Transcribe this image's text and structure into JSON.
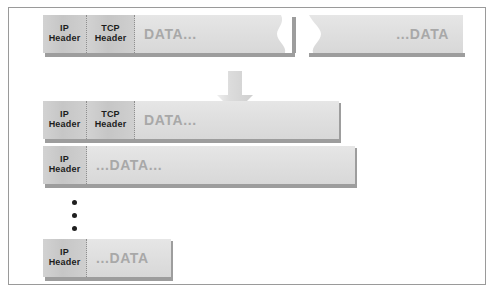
{
  "diagram": {
    "colors": {
      "frame_border": "#9a9a9a",
      "header_fill": "#cccccc",
      "data_fill": "#e0e0e0",
      "data_text": "#a8a8a8",
      "header_text": "#1c1c1c",
      "shadow": "#9d9d9d",
      "arrow": "#d8d8d8",
      "background": "#ffffff"
    },
    "labels": {
      "ip_header_line1": "IP",
      "ip_header_line2": "Header",
      "tcp_header_line1": "TCP",
      "tcp_header_line2": "Header",
      "data_start": "DATA...",
      "data_end": "...DATA",
      "data_middle": "...DATA...",
      "data_last": "...DATA"
    },
    "arrow_icon": "down-arrow-icon",
    "ellipsis_icon": "vertical-ellipsis-icon",
    "tear_icon": "torn-edge-icon",
    "rows": [
      {
        "name": "original-datagram",
        "segments": [
          "IP Header",
          "TCP Header",
          "DATA...",
          "...DATA"
        ],
        "torn": true
      },
      {
        "name": "fragment-first",
        "segments": [
          "IP Header",
          "TCP Header",
          "DATA..."
        ],
        "torn": false
      },
      {
        "name": "fragment-middle",
        "segments": [
          "IP Header",
          "...DATA..."
        ],
        "torn": false
      },
      {
        "name": "fragment-last",
        "segments": [
          "IP Header",
          "...DATA"
        ],
        "torn": false
      }
    ]
  }
}
